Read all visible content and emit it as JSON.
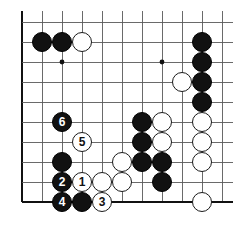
{
  "diagram": {
    "kind": "go-board-diagram",
    "background_color": "#ffffff",
    "line_color": "#5a5a5a",
    "edge_line_color": "#111111",
    "black_color": "#111111",
    "white_color": "#ffffff"
  },
  "board": {
    "origin_x": 22,
    "origin_y": 22,
    "spacing": 20,
    "cols": 11,
    "rows": 10,
    "stone_radius": 10,
    "edges": {
      "left": true,
      "bottom": true,
      "top": false,
      "right": false
    },
    "star_points": [
      {
        "col": 2,
        "row": 2
      },
      {
        "col": 7,
        "row": 2
      },
      {
        "col": 7,
        "row": 7
      }
    ]
  },
  "stones": [
    {
      "col": 1,
      "row": 1,
      "color": "black",
      "label": ""
    },
    {
      "col": 2,
      "row": 1,
      "color": "black",
      "label": ""
    },
    {
      "col": 3,
      "row": 1,
      "color": "white",
      "label": ""
    },
    {
      "col": 9,
      "row": 1,
      "color": "black",
      "label": ""
    },
    {
      "col": 9,
      "row": 2,
      "color": "black",
      "label": ""
    },
    {
      "col": 8,
      "row": 3,
      "color": "white",
      "label": ""
    },
    {
      "col": 9,
      "row": 3,
      "color": "black",
      "label": ""
    },
    {
      "col": 9,
      "row": 4,
      "color": "black",
      "label": ""
    },
    {
      "col": 9,
      "row": 5,
      "color": "white",
      "label": ""
    },
    {
      "col": 9,
      "row": 6,
      "color": "white",
      "label": ""
    },
    {
      "col": 9,
      "row": 7,
      "color": "white",
      "label": ""
    },
    {
      "col": 9,
      "row": 9,
      "color": "white",
      "label": ""
    },
    {
      "col": 6,
      "row": 5,
      "color": "black",
      "label": ""
    },
    {
      "col": 7,
      "row": 5,
      "color": "white",
      "label": ""
    },
    {
      "col": 6,
      "row": 6,
      "color": "black",
      "label": ""
    },
    {
      "col": 7,
      "row": 6,
      "color": "white",
      "label": ""
    },
    {
      "col": 5,
      "row": 7,
      "color": "white",
      "label": ""
    },
    {
      "col": 6,
      "row": 7,
      "color": "black",
      "label": ""
    },
    {
      "col": 7,
      "row": 7,
      "color": "black",
      "label": ""
    },
    {
      "col": 5,
      "row": 8,
      "color": "white",
      "label": ""
    },
    {
      "col": 7,
      "row": 8,
      "color": "black",
      "label": ""
    },
    {
      "col": 2,
      "row": 5,
      "color": "black",
      "label": "6"
    },
    {
      "col": 3,
      "row": 6,
      "color": "white",
      "label": "5"
    },
    {
      "col": 2,
      "row": 7,
      "color": "black",
      "label": ""
    },
    {
      "col": 2,
      "row": 8,
      "color": "black",
      "label": "2"
    },
    {
      "col": 3,
      "row": 8,
      "color": "white",
      "label": "1"
    },
    {
      "col": 4,
      "row": 8,
      "color": "white",
      "label": ""
    },
    {
      "col": 2,
      "row": 9,
      "color": "black",
      "label": "4"
    },
    {
      "col": 3,
      "row": 9,
      "color": "black",
      "label": ""
    },
    {
      "col": 4,
      "row": 9,
      "color": "white",
      "label": "3"
    }
  ],
  "move_sequence": [
    {
      "number": "1",
      "color": "white",
      "col": 3,
      "row": 8
    },
    {
      "number": "2",
      "color": "black",
      "col": 2,
      "row": 8
    },
    {
      "number": "3",
      "color": "white",
      "col": 4,
      "row": 9
    },
    {
      "number": "4",
      "color": "black",
      "col": 2,
      "row": 9
    },
    {
      "number": "5",
      "color": "white",
      "col": 3,
      "row": 6
    },
    {
      "number": "6",
      "color": "black",
      "col": 2,
      "row": 5
    }
  ]
}
